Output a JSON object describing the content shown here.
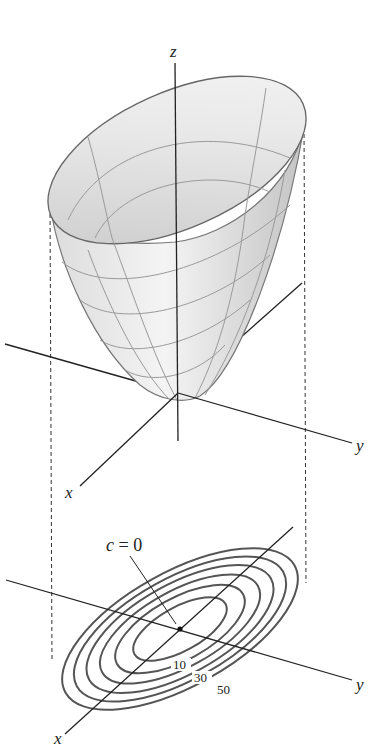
{
  "figure": {
    "surface_panel": {
      "axes": {
        "x_label": "x",
        "y_label": "y",
        "z_label": "z"
      }
    },
    "contour_panel": {
      "axes": {
        "x_label": "x",
        "y_label": "y"
      },
      "annotation": {
        "variable": "c",
        "equals": " = ",
        "value": "0"
      },
      "level_labels": [
        "10",
        "30",
        "50"
      ],
      "level_count": 6
    },
    "colors": {
      "line": "#222222",
      "surface_fill_light": "#f2f2f2",
      "surface_fill_dark": "#c8c8c8",
      "grid": "#9a9a9a",
      "contour": "#555555"
    }
  }
}
